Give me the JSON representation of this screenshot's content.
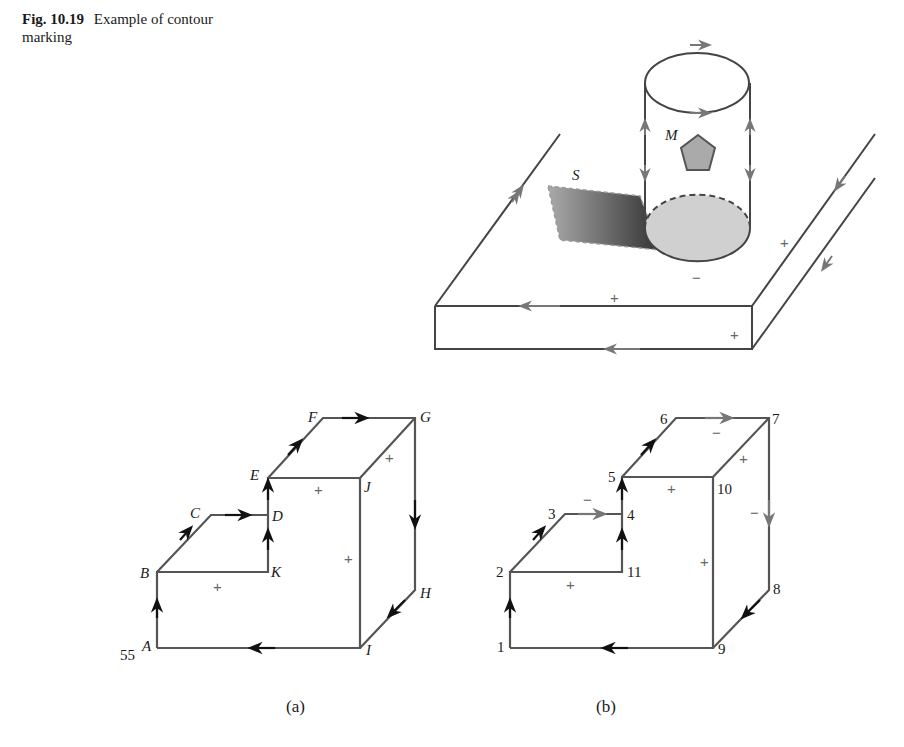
{
  "caption": {
    "figure_number": "Fig. 10.19",
    "text": "Example of contour marking"
  },
  "top_figure": {
    "labels": {
      "surface": "S",
      "marker": "M"
    },
    "signs": [
      "+",
      "+",
      "+",
      "−"
    ]
  },
  "figure_a": {
    "points": [
      "A",
      "B",
      "C",
      "D",
      "E",
      "F",
      "G",
      "H",
      "I",
      "J",
      "K"
    ],
    "extra_label": "55",
    "signs": [
      "+",
      "+",
      "+",
      "+"
    ],
    "sublabel": "(a)"
  },
  "figure_b": {
    "points": [
      "1",
      "2",
      "3",
      "4",
      "5",
      "6",
      "7",
      "8",
      "9",
      "10",
      "11"
    ],
    "signs_plus": [
      "+",
      "+",
      "+",
      "+"
    ],
    "signs_minus": [
      "−",
      "−",
      "−"
    ],
    "sublabel": "(b)"
  },
  "colors": {
    "line": "#555555",
    "arrow_dark": "#111111",
    "arrow_gray": "#777777",
    "fill_gray": "#d0d0d0"
  }
}
